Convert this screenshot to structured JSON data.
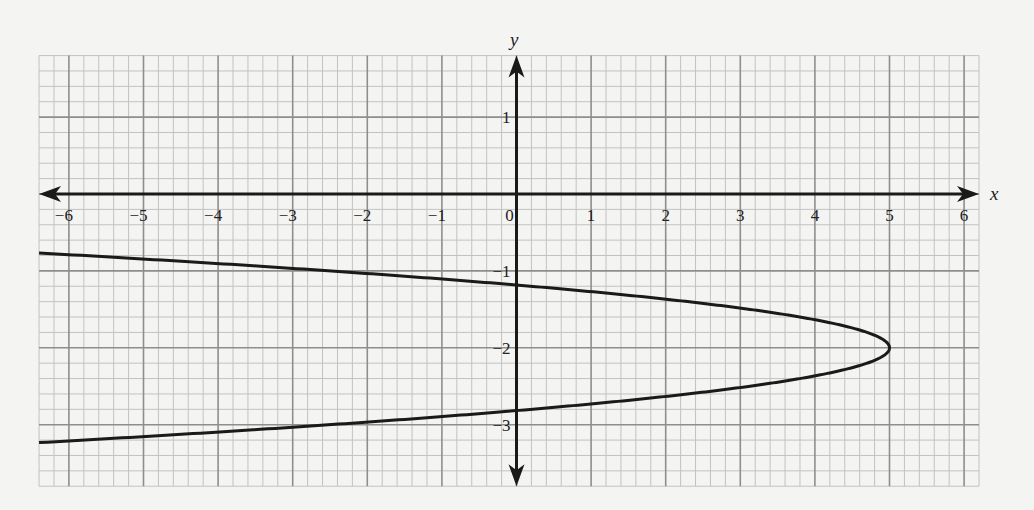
{
  "chart_data": {
    "type": "line",
    "title": "",
    "xlabel": "x",
    "ylabel": "y",
    "xlim": [
      -6.4,
      6.2
    ],
    "ylim": [
      -3.8,
      1.8
    ],
    "grid": true,
    "grid_minor_step": 0.2,
    "grid_major_step": 1,
    "legend": null,
    "x_ticks": [
      -6,
      -5,
      -4,
      -3,
      -2,
      -1,
      0,
      1,
      2,
      3,
      4,
      5,
      6
    ],
    "x_tick_labels": [
      "−6",
      "−5",
      "−4",
      "−3",
      "−2",
      "−1",
      "0",
      "1",
      "2",
      "3",
      "4",
      "5",
      "6"
    ],
    "y_ticks": [
      1,
      -1,
      -2,
      -3
    ],
    "y_tick_labels": [
      "1",
      "−1",
      "−2",
      "−3"
    ],
    "series": [
      {
        "name": "parabola",
        "equation": "x = -7.5(y + 2)^2 + 5",
        "vertex": [
          5,
          -2
        ],
        "opens": "left",
        "color": "#1a1a1a",
        "points": [
          {
            "x": -6.4,
            "y": -0.767
          },
          {
            "x": -6,
            "y": -0.789
          },
          {
            "x": -5,
            "y": -0.845
          },
          {
            "x": -4,
            "y": -0.905
          },
          {
            "x": -3,
            "y": -0.967
          },
          {
            "x": -2,
            "y": -1.034
          },
          {
            "x": -1,
            "y": -1.106
          },
          {
            "x": 0,
            "y": -1.184
          },
          {
            "x": 1,
            "y": -1.27
          },
          {
            "x": 2,
            "y": -1.368
          },
          {
            "x": 3,
            "y": -1.484
          },
          {
            "x": 4,
            "y": -1.635
          },
          {
            "x": 4.5,
            "y": -1.742
          },
          {
            "x": 5,
            "y": -2
          },
          {
            "x": 4.5,
            "y": -2.258
          },
          {
            "x": 4,
            "y": -2.365
          },
          {
            "x": 3,
            "y": -2.516
          },
          {
            "x": 2,
            "y": -2.632
          },
          {
            "x": 1,
            "y": -2.73
          },
          {
            "x": 0,
            "y": -2.816
          },
          {
            "x": -1,
            "y": -2.894
          },
          {
            "x": -2,
            "y": -2.966
          },
          {
            "x": -3,
            "y": -3.033
          },
          {
            "x": -4,
            "y": -3.095
          },
          {
            "x": -5,
            "y": -3.155
          },
          {
            "x": -6,
            "y": -3.211
          },
          {
            "x": -6.4,
            "y": -3.233
          }
        ]
      }
    ]
  },
  "colors": {
    "background": "#f4f4f2",
    "grid_minor": "#c2c2c2",
    "grid_major": "#8e8e8e",
    "axis": "#1a1a1a",
    "curve": "#1a1a1a"
  }
}
